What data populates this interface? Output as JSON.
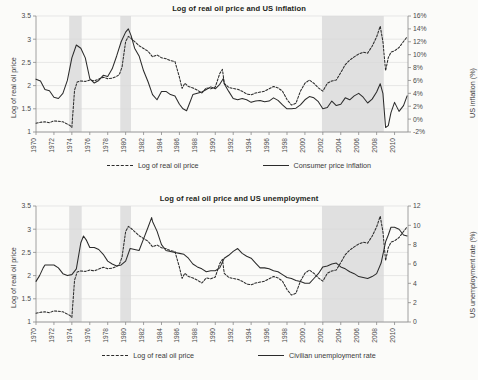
{
  "figure": {
    "background": "#fbfbf9",
    "ink": "#2b2b2b",
    "grid_color": "#d9d9d9",
    "recession_color": "#e0e0e0"
  },
  "charts": [
    {
      "id": "oil-inflation",
      "type": "line",
      "title": "Log of real oil price and US inflation",
      "xlabel": "",
      "ylabel": "Log of real oil price",
      "y2label": "US inflation (%)",
      "grid": true,
      "legend_position": "bottom",
      "xlim": [
        1970,
        2011.5
      ],
      "ylim": [
        1,
        3.5
      ],
      "y2lim": [
        -2,
        16
      ],
      "xticks": [
        "1970",
        "1972",
        "1974",
        "1976",
        "1978",
        "1980",
        "1982",
        "1984",
        "1986",
        "1988",
        "1990",
        "1992",
        "1994",
        "1996",
        "1998",
        "2000",
        "2002",
        "2004",
        "2006",
        "2008",
        "2010"
      ],
      "yticks": [
        "1",
        "1.5",
        "2",
        "2.5",
        "3",
        "3.5"
      ],
      "y2ticks": [
        "-2%",
        "0%",
        "2%",
        "4%",
        "6%",
        "8%",
        "10%",
        "12%",
        "14%",
        "16%"
      ],
      "shaded_bands": [
        [
          1973.7,
          1975.1
        ],
        [
          1979.4,
          1980.6
        ],
        [
          2001.9,
          2008.8
        ]
      ],
      "series": [
        {
          "name": "Log of real oil price",
          "style": "dashed",
          "axis": "left",
          "x": [
            1970.0,
            1970.5,
            1971.0,
            1971.5,
            1972.0,
            1972.5,
            1973.0,
            1973.3,
            1973.6,
            1973.8,
            1974.0,
            1974.3,
            1974.6,
            1975.0,
            1975.5,
            1976.0,
            1976.5,
            1977.0,
            1977.5,
            1978.0,
            1978.5,
            1979.0,
            1979.3,
            1979.6,
            1980.0,
            1980.3,
            1980.6,
            1981.0,
            1981.5,
            1982.0,
            1982.5,
            1983.0,
            1983.5,
            1984.0,
            1984.5,
            1985.0,
            1985.5,
            1986.0,
            1986.3,
            1986.6,
            1987.0,
            1987.5,
            1988.0,
            1988.5,
            1989.0,
            1989.5,
            1990.0,
            1990.5,
            1990.8,
            1991.0,
            1991.5,
            1992.0,
            1992.5,
            1993.0,
            1993.5,
            1994.0,
            1994.5,
            1995.0,
            1995.5,
            1996.0,
            1996.5,
            1997.0,
            1997.5,
            1998.0,
            1998.5,
            1999.0,
            1999.5,
            2000.0,
            2000.5,
            2001.0,
            2001.5,
            2002.0,
            2002.5,
            2003.0,
            2003.5,
            2004.0,
            2004.5,
            2005.0,
            2005.5,
            2006.0,
            2006.5,
            2007.0,
            2007.5,
            2008.0,
            2008.4,
            2008.7,
            2009.0,
            2009.3,
            2009.6,
            2010.0,
            2010.5,
            2011.0,
            2011.4
          ],
          "y": [
            1.19,
            1.21,
            1.22,
            1.2,
            1.24,
            1.23,
            1.22,
            1.19,
            1.16,
            1.14,
            1.1,
            1.9,
            2.08,
            2.1,
            2.09,
            2.12,
            2.1,
            2.14,
            2.18,
            2.15,
            2.16,
            2.2,
            2.24,
            2.4,
            2.95,
            3.06,
            3.02,
            2.95,
            2.86,
            2.8,
            2.74,
            2.62,
            2.66,
            2.6,
            2.58,
            2.54,
            2.52,
            2.18,
            1.94,
            2.05,
            1.98,
            1.95,
            1.9,
            1.84,
            1.95,
            1.93,
            1.97,
            2.26,
            2.35,
            2.05,
            1.96,
            1.94,
            1.92,
            1.88,
            1.82,
            1.8,
            1.84,
            1.86,
            1.88,
            1.93,
            1.98,
            1.95,
            1.88,
            1.7,
            1.58,
            1.62,
            1.88,
            2.05,
            2.12,
            2.05,
            1.95,
            1.88,
            2.05,
            2.1,
            2.12,
            2.28,
            2.45,
            2.55,
            2.62,
            2.68,
            2.72,
            2.7,
            2.85,
            3.05,
            3.28,
            2.95,
            2.32,
            2.6,
            2.72,
            2.75,
            2.82,
            2.95,
            3.05
          ]
        },
        {
          "name": "Consumer price inflation",
          "style": "solid",
          "axis": "right",
          "x": [
            1970.0,
            1970.5,
            1971.0,
            1971.5,
            1972.0,
            1972.5,
            1973.0,
            1973.5,
            1974.0,
            1974.5,
            1975.0,
            1975.5,
            1976.0,
            1976.5,
            1977.0,
            1977.5,
            1978.0,
            1978.5,
            1979.0,
            1979.5,
            1980.0,
            1980.3,
            1980.6,
            1981.0,
            1981.5,
            1982.0,
            1982.5,
            1983.0,
            1983.5,
            1984.0,
            1984.5,
            1985.0,
            1985.5,
            1986.0,
            1986.4,
            1986.8,
            1987.0,
            1987.5,
            1988.0,
            1988.5,
            1989.0,
            1989.5,
            1990.0,
            1990.5,
            1990.9,
            1991.0,
            1991.5,
            1992.0,
            1992.5,
            1993.0,
            1993.5,
            1994.0,
            1994.5,
            1995.0,
            1995.5,
            1996.0,
            1996.5,
            1997.0,
            1997.5,
            1998.0,
            1998.5,
            1999.0,
            1999.5,
            2000.0,
            2000.5,
            2001.0,
            2001.5,
            2002.0,
            2002.5,
            2003.0,
            2003.5,
            2004.0,
            2004.5,
            2005.0,
            2005.5,
            2006.0,
            2006.5,
            2007.0,
            2007.5,
            2008.0,
            2008.4,
            2008.7,
            2009.0,
            2009.3,
            2009.6,
            2010.0,
            2010.5,
            2011.0,
            2011.4
          ],
          "y": [
            6.2,
            5.9,
            4.6,
            4.4,
            3.4,
            3.2,
            4.0,
            6.0,
            9.5,
            11.5,
            11.0,
            9.5,
            6.3,
            5.6,
            6.0,
            6.8,
            6.6,
            7.8,
            9.8,
            12.0,
            13.5,
            14.0,
            13.0,
            11.0,
            9.8,
            7.5,
            5.8,
            3.8,
            3.0,
            4.3,
            4.3,
            3.8,
            3.6,
            2.3,
            1.6,
            1.3,
            2.0,
            3.8,
            4.0,
            4.2,
            4.6,
            5.0,
            4.7,
            5.4,
            6.3,
            5.5,
            4.3,
            3.2,
            3.0,
            3.2,
            3.0,
            2.6,
            2.8,
            2.9,
            2.7,
            2.8,
            3.3,
            2.9,
            2.2,
            1.6,
            1.6,
            1.7,
            2.2,
            3.0,
            3.5,
            3.3,
            2.7,
            1.6,
            1.8,
            2.8,
            2.1,
            2.3,
            3.3,
            3.0,
            3.6,
            4.0,
            3.4,
            2.5,
            3.1,
            4.2,
            5.5,
            4.0,
            -1.3,
            -1.0,
            1.0,
            2.6,
            1.2,
            2.1,
            3.6
          ]
        }
      ]
    },
    {
      "id": "oil-unemployment",
      "type": "line",
      "title": "Log of real oil price and US unemployment",
      "xlabel": "",
      "ylabel": "Log of real oil price",
      "y2label": "US unemployment rate (%)",
      "grid": true,
      "legend_position": "bottom",
      "xlim": [
        1970,
        2011.5
      ],
      "ylim": [
        1,
        3.5
      ],
      "y2lim": [
        0,
        12
      ],
      "xticks": [
        "1970",
        "1972",
        "1974",
        "1976",
        "1978",
        "1980",
        "1982",
        "1984",
        "1986",
        "1988",
        "1990",
        "1992",
        "1994",
        "1996",
        "1998",
        "2000",
        "2002",
        "2004",
        "2006",
        "2008",
        "2010"
      ],
      "yticks": [
        "1",
        "1.5",
        "2",
        "2.5",
        "3",
        "3.5"
      ],
      "y2ticks": [
        "0",
        "2",
        "4",
        "6",
        "8",
        "10",
        "12"
      ],
      "shaded_bands": [
        [
          1973.7,
          1975.1
        ],
        [
          1979.4,
          1980.6
        ],
        [
          2001.9,
          2008.8
        ]
      ],
      "series": [
        {
          "name": "Log of real oil price",
          "style": "dashed",
          "axis": "left",
          "x": [
            1970.0,
            1970.5,
            1971.0,
            1971.5,
            1972.0,
            1972.5,
            1973.0,
            1973.3,
            1973.6,
            1973.8,
            1974.0,
            1974.3,
            1974.6,
            1975.0,
            1975.5,
            1976.0,
            1976.5,
            1977.0,
            1977.5,
            1978.0,
            1978.5,
            1979.0,
            1979.3,
            1979.6,
            1980.0,
            1980.3,
            1980.6,
            1981.0,
            1981.5,
            1982.0,
            1982.5,
            1983.0,
            1983.5,
            1984.0,
            1984.5,
            1985.0,
            1985.5,
            1986.0,
            1986.3,
            1986.6,
            1987.0,
            1987.5,
            1988.0,
            1988.5,
            1989.0,
            1989.5,
            1990.0,
            1990.5,
            1990.8,
            1991.0,
            1991.5,
            1992.0,
            1992.5,
            1993.0,
            1993.5,
            1994.0,
            1994.5,
            1995.0,
            1995.5,
            1996.0,
            1996.5,
            1997.0,
            1997.5,
            1998.0,
            1998.5,
            1999.0,
            1999.5,
            2000.0,
            2000.5,
            2001.0,
            2001.5,
            2002.0,
            2002.5,
            2003.0,
            2003.5,
            2004.0,
            2004.5,
            2005.0,
            2005.5,
            2006.0,
            2006.5,
            2007.0,
            2007.5,
            2008.0,
            2008.4,
            2008.7,
            2009.0,
            2009.3,
            2009.6,
            2010.0,
            2010.5,
            2011.0,
            2011.4
          ],
          "y": [
            1.19,
            1.21,
            1.22,
            1.2,
            1.24,
            1.23,
            1.22,
            1.19,
            1.16,
            1.14,
            1.1,
            1.9,
            2.08,
            2.1,
            2.09,
            2.12,
            2.1,
            2.14,
            2.18,
            2.15,
            2.16,
            2.2,
            2.24,
            2.4,
            2.95,
            3.06,
            3.02,
            2.95,
            2.86,
            2.8,
            2.74,
            2.62,
            2.66,
            2.6,
            2.58,
            2.54,
            2.52,
            2.18,
            1.94,
            2.05,
            1.98,
            1.95,
            1.9,
            1.84,
            1.95,
            1.93,
            1.97,
            2.26,
            2.35,
            2.05,
            1.96,
            1.94,
            1.92,
            1.88,
            1.82,
            1.8,
            1.84,
            1.86,
            1.88,
            1.93,
            1.98,
            1.95,
            1.88,
            1.7,
            1.58,
            1.62,
            1.88,
            2.05,
            2.12,
            2.05,
            1.95,
            1.88,
            2.05,
            2.1,
            2.12,
            2.28,
            2.45,
            2.55,
            2.62,
            2.68,
            2.72,
            2.7,
            2.85,
            3.05,
            3.28,
            2.95,
            2.32,
            2.6,
            2.72,
            2.75,
            2.82,
            2.95,
            3.05
          ]
        },
        {
          "name": "Civilian unemployment rate",
          "style": "solid",
          "axis": "right",
          "x": [
            1970.0,
            1970.4,
            1970.8,
            1971.0,
            1971.5,
            1972.0,
            1972.5,
            1973.0,
            1973.5,
            1974.0,
            1974.5,
            1975.0,
            1975.3,
            1975.6,
            1976.0,
            1976.5,
            1977.0,
            1977.5,
            1978.0,
            1978.5,
            1979.0,
            1979.5,
            1980.0,
            1980.5,
            1981.0,
            1981.5,
            1982.0,
            1982.5,
            1982.9,
            1983.0,
            1983.5,
            1984.0,
            1984.5,
            1985.0,
            1985.5,
            1986.0,
            1986.5,
            1987.0,
            1987.5,
            1988.0,
            1988.5,
            1989.0,
            1989.5,
            1990.0,
            1990.5,
            1991.0,
            1991.5,
            1992.0,
            1992.5,
            1993.0,
            1993.5,
            1994.0,
            1994.5,
            1995.0,
            1995.5,
            1996.0,
            1996.5,
            1997.0,
            1997.5,
            1998.0,
            1998.5,
            1999.0,
            1999.5,
            2000.0,
            2000.5,
            2001.0,
            2001.5,
            2002.0,
            2002.5,
            2003.0,
            2003.5,
            2004.0,
            2004.5,
            2005.0,
            2005.5,
            2006.0,
            2006.5,
            2007.0,
            2007.5,
            2008.0,
            2008.5,
            2009.0,
            2009.3,
            2009.6,
            2010.0,
            2010.5,
            2011.0,
            2011.4
          ],
          "y": [
            4.2,
            4.8,
            5.6,
            5.9,
            5.9,
            5.9,
            5.6,
            5.0,
            4.8,
            4.9,
            5.5,
            8.2,
            8.9,
            8.5,
            7.7,
            7.7,
            7.5,
            7.0,
            6.3,
            6.0,
            5.8,
            5.9,
            6.3,
            7.6,
            7.5,
            7.4,
            8.6,
            9.8,
            10.8,
            10.4,
            9.4,
            8.0,
            7.4,
            7.3,
            7.2,
            7.1,
            7.0,
            6.6,
            6.0,
            5.7,
            5.5,
            5.2,
            5.3,
            5.3,
            5.6,
            6.6,
            6.9,
            7.3,
            7.6,
            7.1,
            6.8,
            6.6,
            6.1,
            5.6,
            5.6,
            5.5,
            5.3,
            5.2,
            4.9,
            4.6,
            4.5,
            4.3,
            4.2,
            4.0,
            4.0,
            4.5,
            5.0,
            5.7,
            5.8,
            6.0,
            6.1,
            5.7,
            5.5,
            5.2,
            5.0,
            4.7,
            4.6,
            4.5,
            4.7,
            5.0,
            6.1,
            8.3,
            9.0,
            9.8,
            9.8,
            9.6,
            9.0,
            8.9
          ]
        }
      ]
    }
  ]
}
